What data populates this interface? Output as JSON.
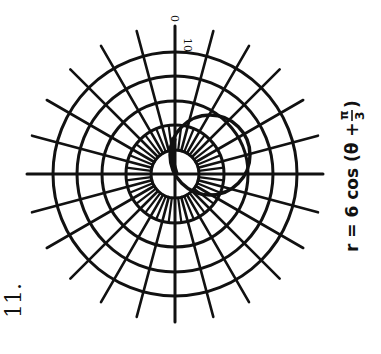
{
  "problem_number": "11.",
  "equation_label": "r = 6 cos (θ + π/3)",
  "equation_parts": {
    "lhs": "r = 6 cos (θ + ",
    "frac_num": "π",
    "frac_den": "3",
    "close": ")"
  },
  "axis_labels": {
    "top_outer": "0",
    "top_inner": "10"
  },
  "colors": {
    "ink": "#111111",
    "background": "#ffffff"
  },
  "chart_data": {
    "type": "polar",
    "grid": {
      "rings": [
        2,
        4,
        6,
        8,
        10
      ],
      "ring_radius_px": [
        24,
        49,
        73,
        98,
        122
      ],
      "spoke_step_deg_outer": 15,
      "spoke_step_deg_inner": 7.5,
      "inner_spokes_between_rings": [
        2,
        4
      ],
      "spoke_length_px": 148
    },
    "center_px": [
      175,
      174
    ],
    "curve": {
      "kind": "circle through pole",
      "diameter": 6,
      "center_px": [
        210,
        155
      ],
      "radius_px": 40
    },
    "annotations": [
      "0",
      "10"
    ]
  }
}
